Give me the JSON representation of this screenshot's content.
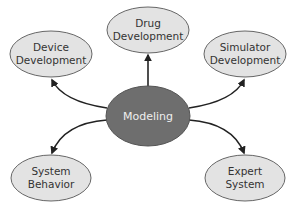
{
  "diagram": {
    "type": "hub-and-spoke",
    "center": {
      "label": "Modeling",
      "fill": "#6e6e6e"
    },
    "nodes": [
      {
        "id": "device",
        "line1": "Device",
        "line2": "Development"
      },
      {
        "id": "drug",
        "line1": "Drug",
        "line2": "Development"
      },
      {
        "id": "simulator",
        "line1": "Simulator",
        "line2": "Development"
      },
      {
        "id": "system",
        "line1": "System",
        "line2": "Behavior"
      },
      {
        "id": "expert",
        "line1": "Expert",
        "line2": "System"
      }
    ],
    "node_fill": "#e3e3e3",
    "edge_color": "#222222",
    "edges": [
      {
        "from": "Modeling",
        "to": "Device Development"
      },
      {
        "from": "Modeling",
        "to": "Drug Development"
      },
      {
        "from": "Modeling",
        "to": "Simulator Development"
      },
      {
        "from": "Modeling",
        "to": "System Behavior"
      },
      {
        "from": "Modeling",
        "to": "Expert System"
      }
    ]
  }
}
